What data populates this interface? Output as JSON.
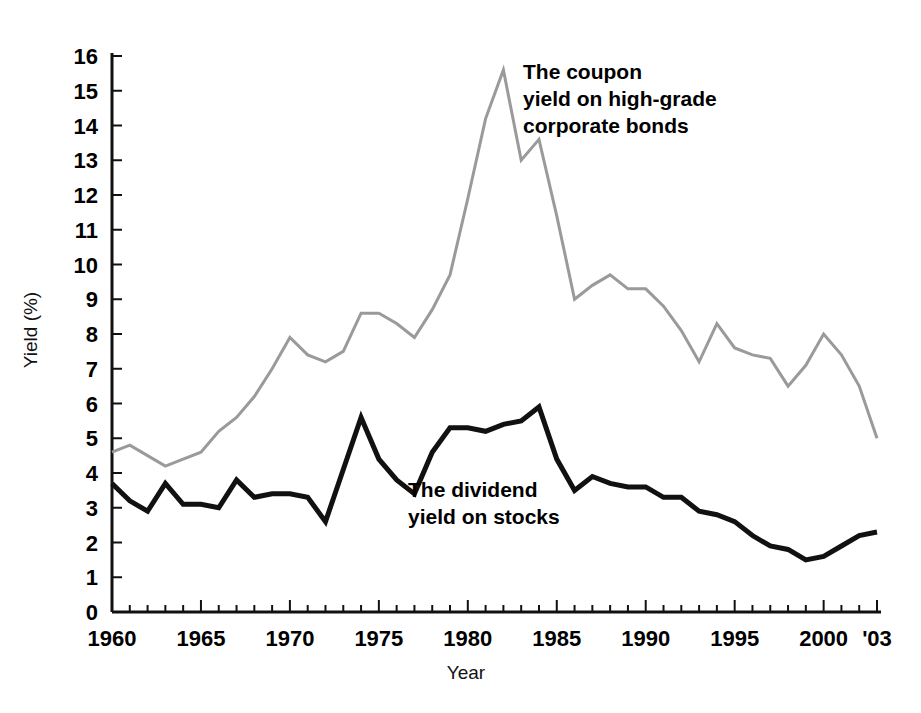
{
  "chart_data": {
    "type": "line",
    "title": "",
    "xlabel": "Year",
    "ylabel": "Yield (%)",
    "xlim": [
      1960,
      2003
    ],
    "ylim": [
      0,
      16
    ],
    "grid": false,
    "legend_position": "inline-annotations",
    "y_ticks": [
      0,
      1,
      2,
      3,
      4,
      5,
      6,
      7,
      8,
      9,
      10,
      11,
      12,
      13,
      14,
      15,
      16
    ],
    "y_tick_labels": [
      "0",
      "1",
      "2",
      "3",
      "4",
      "5",
      "6",
      "7",
      "8",
      "9",
      "10",
      "11",
      "12",
      "13",
      "14",
      "15",
      "16"
    ],
    "x_ticks": [
      1960,
      1965,
      1970,
      1975,
      1980,
      1985,
      1990,
      1995,
      2000,
      2003
    ],
    "x_tick_labels": [
      "1960",
      "1965",
      "1970",
      "1975",
      "1980",
      "1985",
      "1990",
      "1995",
      "2000",
      "'03"
    ],
    "x_minor_tick_interval": 1,
    "x": [
      1960,
      1961,
      1962,
      1963,
      1964,
      1965,
      1966,
      1967,
      1968,
      1969,
      1970,
      1971,
      1972,
      1973,
      1974,
      1975,
      1976,
      1977,
      1978,
      1979,
      1980,
      1981,
      1982,
      1983,
      1984,
      1985,
      1986,
      1987,
      1988,
      1989,
      1990,
      1991,
      1992,
      1993,
      1994,
      1995,
      1996,
      1997,
      1998,
      1999,
      2000,
      2001,
      2002,
      2003
    ],
    "series": [
      {
        "name": "The coupon yield on high-grade corporate bonds",
        "color": "#9a9a9a",
        "width": 3,
        "values": [
          4.6,
          4.8,
          4.5,
          4.2,
          4.4,
          4.6,
          5.2,
          5.6,
          6.2,
          7.0,
          7.9,
          7.4,
          7.2,
          7.5,
          8.6,
          8.6,
          8.3,
          7.9,
          8.7,
          9.7,
          11.9,
          14.2,
          15.6,
          13.0,
          13.6,
          11.4,
          9.0,
          9.4,
          9.7,
          9.3,
          9.3,
          8.8,
          8.1,
          7.2,
          8.3,
          7.6,
          7.4,
          7.3,
          6.5,
          7.1,
          8.0,
          7.4,
          6.5,
          5.0
        ]
      },
      {
        "name": "The dividend yield on stocks",
        "color": "#111111",
        "width": 5,
        "values": [
          3.7,
          3.2,
          2.9,
          3.7,
          3.1,
          3.1,
          3.0,
          3.8,
          3.3,
          3.4,
          3.4,
          3.3,
          2.6,
          4.1,
          5.6,
          4.4,
          3.8,
          3.4,
          4.6,
          5.3,
          5.3,
          5.2,
          5.4,
          5.5,
          5.9,
          4.4,
          3.5,
          3.9,
          3.7,
          3.6,
          3.6,
          3.3,
          3.3,
          2.9,
          2.8,
          2.6,
          2.2,
          1.9,
          1.8,
          1.5,
          1.6,
          1.9,
          2.2,
          2.3
        ]
      }
    ],
    "annotations": [
      {
        "name": "bond-series-annotation",
        "lines": [
          "The coupon",
          "yield on high-grade",
          "corporate bonds"
        ],
        "x": 523,
        "y": 79
      },
      {
        "name": "stock-series-annotation",
        "lines": [
          "The dividend",
          "yield on stocks"
        ],
        "x": 408,
        "y": 497
      }
    ]
  }
}
